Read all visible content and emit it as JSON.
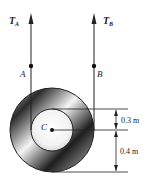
{
  "diagram": {
    "forces": [
      {
        "label": "T",
        "subscript": "A",
        "point": "A"
      },
      {
        "label": "T",
        "subscript": "B",
        "point": "B"
      }
    ],
    "center_label": "C",
    "dimensions": [
      {
        "label": "0.3 m"
      },
      {
        "label": "0.4 m"
      }
    ],
    "colors": {
      "line": "#222222",
      "outer_dark": "#1a1a1a",
      "inner_light": "#ffffff"
    }
  }
}
